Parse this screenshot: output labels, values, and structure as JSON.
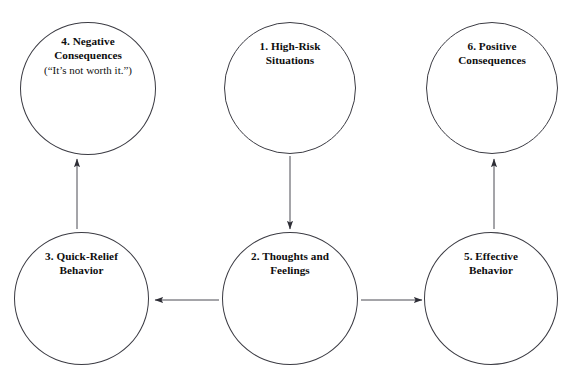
{
  "diagram": {
    "stroke_color": "#3b3b43",
    "text_color": "#0d0d0d",
    "background_color": "#ffffff",
    "nodes": [
      {
        "id": "node-1",
        "name": "high-risk-situations",
        "label": "1. High-Risk\nSituations",
        "subtext": ""
      },
      {
        "id": "node-2",
        "name": "thoughts-and-feelings",
        "label": "2. Thoughts and\nFeelings",
        "subtext": ""
      },
      {
        "id": "node-3",
        "name": "quick-relief-behavior",
        "label": "3. Quick-Relief\nBehavior",
        "subtext": ""
      },
      {
        "id": "node-4",
        "name": "negative-consequences",
        "label": "4. Negative\nConsequences",
        "subtext": "(“It’s not worth it.”)"
      },
      {
        "id": "node-5",
        "name": "effective-behavior",
        "label": "5. Effective\nBehavior",
        "subtext": ""
      },
      {
        "id": "node-6",
        "name": "positive-consequences",
        "label": "6. Positive\nConsequences",
        "subtext": ""
      }
    ],
    "edges": [
      {
        "from": "node-1",
        "to": "node-2",
        "direction": "down"
      },
      {
        "from": "node-2",
        "to": "node-3",
        "direction": "left"
      },
      {
        "from": "node-2",
        "to": "node-5",
        "direction": "right"
      },
      {
        "from": "node-3",
        "to": "node-4",
        "direction": "up"
      },
      {
        "from": "node-5",
        "to": "node-6",
        "direction": "up"
      }
    ]
  }
}
